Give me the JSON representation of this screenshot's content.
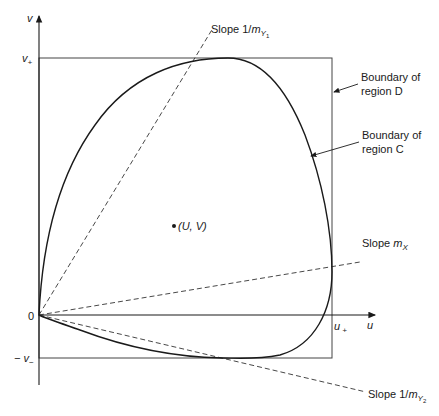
{
  "diagram": {
    "axes": {
      "x_label": "u",
      "y_label": "v",
      "origin_label": "0",
      "u_plus_label": "u",
      "u_plus_sub": "+",
      "v_plus_label": "v",
      "v_plus_sub": "+",
      "v_minus_label": "− v",
      "v_minus_sub": "−"
    },
    "point": {
      "label": "(U, V)"
    },
    "annotations": {
      "slope_y1_prefix": "Slope 1/",
      "slope_y1_var": "m",
      "slope_y1_sub": "Y",
      "slope_y1_subsub": "1",
      "slope_x_prefix": "Slope ",
      "slope_x_var": "m",
      "slope_x_sub": "X",
      "slope_y2_prefix": "Slope 1/",
      "slope_y2_var": "m",
      "slope_y2_sub": "Y",
      "slope_y2_subsub": "2",
      "boundary_d_line1": "Boundary of",
      "boundary_d_line2": "region D",
      "boundary_c_line1": "Boundary of",
      "boundary_c_line2": "region C"
    },
    "colors": {
      "stroke": "#1a1a1a",
      "box": "#444444",
      "background": "#ffffff"
    }
  }
}
